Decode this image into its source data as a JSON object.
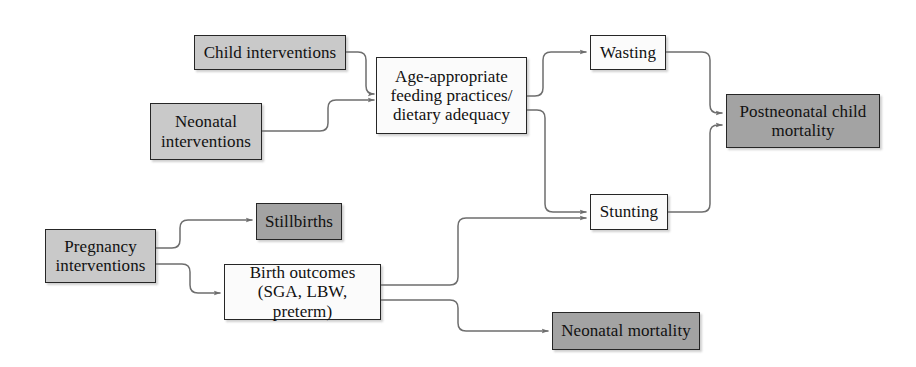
{
  "diagram": {
    "type": "flowchart",
    "canvas": {
      "width": 916,
      "height": 367
    },
    "palette": {
      "intervention_fill": "#c9c9c9",
      "intermediate_fill": "#fbfbfb",
      "outcome_fill": "#a3a3a3",
      "border": "#262626",
      "connector": "#6e6e6e",
      "text": "#111111",
      "background": "#ffffff"
    },
    "nodes": [
      {
        "id": "child-interventions",
        "label": "Child interventions",
        "category": "intervention",
        "fill": "light",
        "x": 194,
        "y": 35,
        "w": 152,
        "h": 35,
        "font_size": 17
      },
      {
        "id": "neonatal-interventions",
        "label": "Neonatal\ninterventions",
        "category": "intervention",
        "fill": "light",
        "x": 150,
        "y": 103,
        "w": 112,
        "h": 57,
        "font_size": 17
      },
      {
        "id": "feeding-practices",
        "label": "Age-appropriate\nfeeding practices/\ndietary adequacy",
        "category": "intermediate",
        "fill": "white",
        "x": 376,
        "y": 57,
        "w": 151,
        "h": 77,
        "font_size": 17
      },
      {
        "id": "wasting",
        "label": "Wasting",
        "category": "intermediate",
        "fill": "white",
        "x": 590,
        "y": 35,
        "w": 76,
        "h": 35,
        "font_size": 17
      },
      {
        "id": "postneonatal-child-mortality",
        "label": "Postneonatal child\nmortality",
        "category": "outcome",
        "fill": "dark",
        "x": 726,
        "y": 94,
        "w": 154,
        "h": 54,
        "font_size": 17
      },
      {
        "id": "pregnancy-interventions",
        "label": "Pregnancy\ninterventions",
        "category": "intervention",
        "fill": "light",
        "x": 45,
        "y": 229,
        "w": 111,
        "h": 54,
        "font_size": 17
      },
      {
        "id": "stillbirths",
        "label": "Stillbirths",
        "category": "outcome",
        "fill": "dark",
        "x": 256,
        "y": 203,
        "w": 86,
        "h": 37,
        "font_size": 17
      },
      {
        "id": "birth-outcomes",
        "label": "Birth outcomes\n(SGA, LBW, preterm)",
        "category": "intermediate",
        "fill": "white",
        "x": 224,
        "y": 264,
        "w": 157,
        "h": 56,
        "font_size": 17
      },
      {
        "id": "stunting",
        "label": "Stunting",
        "category": "intermediate",
        "fill": "white",
        "x": 590,
        "y": 194,
        "w": 78,
        "h": 36,
        "font_size": 17
      },
      {
        "id": "neonatal-mortality",
        "label": "Neonatal mortality",
        "category": "outcome",
        "fill": "dark",
        "x": 552,
        "y": 312,
        "w": 148,
        "h": 38,
        "font_size": 17
      }
    ],
    "edges": [
      {
        "id": "edge-child-to-feeding",
        "from": "child-interventions",
        "to": "feeding-practices",
        "path": "M 346,52 L 358,52 Q 366,52 366,60 L 366,86 Q 366,94 374,94 L 374,94"
      },
      {
        "id": "edge-neonatal-to-feeding",
        "from": "neonatal-interventions",
        "to": "feeding-practices",
        "path": "M 262,131 L 320,131 Q 328,131 328,123 L 328,108 Q 328,100 336,100 L 374,100"
      },
      {
        "id": "edge-feeding-to-wasting",
        "from": "feeding-practices",
        "to": "wasting",
        "path": "M 527,96 L 535,96 Q 543,96 543,88 L 543,60 Q 543,52 551,52 L 586,52"
      },
      {
        "id": "edge-feeding-to-stunting",
        "from": "feeding-practices",
        "to": "stunting",
        "path": "M 527,110 L 537,110 Q 545,110 545,118 L 545,204 Q 545,212 553,212 L 586,212"
      },
      {
        "id": "edge-wasting-to-postneonatal",
        "from": "wasting",
        "to": "postneonatal-child-mortality",
        "path": "M 666,52 L 702,52 Q 710,52 710,60 L 710,105 Q 710,113 718,113 L 722,113"
      },
      {
        "id": "edge-stunting-to-postneonatal",
        "from": "stunting",
        "to": "postneonatal-child-mortality",
        "path": "M 668,212 L 702,212 Q 710,212 710,204 L 710,133 Q 710,125 718,125 L 722,125"
      },
      {
        "id": "edge-pregnancy-to-stillbirths",
        "from": "pregnancy-interventions",
        "to": "stillbirths",
        "path": "M 156,248 L 172,248 Q 180,248 180,240 L 180,228 Q 180,220 188,220 L 252,220"
      },
      {
        "id": "edge-pregnancy-to-birth",
        "from": "pregnancy-interventions",
        "to": "birth-outcomes",
        "path": "M 156,264 L 182,264 Q 190,264 190,272 L 190,285 Q 190,293 198,293 L 220,293"
      },
      {
        "id": "edge-birth-to-stunting",
        "from": "birth-outcomes",
        "to": "stunting",
        "path": "M 381,285 L 450,285 Q 458,285 458,277 L 458,226 Q 458,218 466,218 L 586,218"
      },
      {
        "id": "edge-birth-to-neonatal",
        "from": "birth-outcomes",
        "to": "neonatal-mortality",
        "path": "M 381,300 L 450,300 Q 458,300 458,308 L 458,323 Q 458,331 466,331 L 548,331"
      }
    ]
  }
}
